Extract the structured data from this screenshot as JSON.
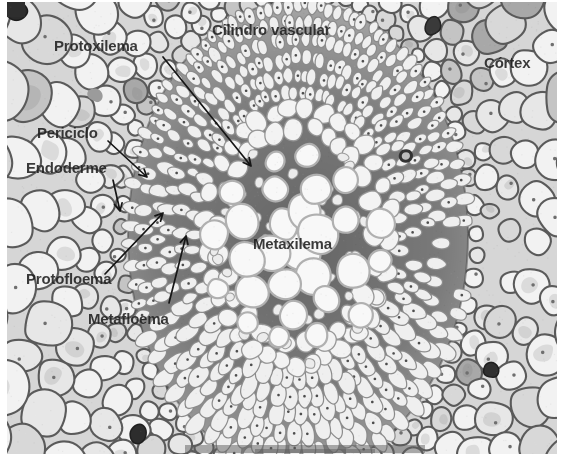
{
  "figure": {
    "labels": [
      {
        "id": "protoxilema",
        "text": "Protoxilema",
        "x": 54,
        "y": 37
      },
      {
        "id": "cilindro-vascular",
        "text": "Cilindro vascular",
        "x": 212,
        "y": 21
      },
      {
        "id": "cortex",
        "text": "Córtex",
        "x": 484,
        "y": 54
      },
      {
        "id": "periciclo",
        "text": "Periciclo",
        "x": 37,
        "y": 124
      },
      {
        "id": "endoderme",
        "text": "Endoderme",
        "x": 26,
        "y": 159
      },
      {
        "id": "protofloema",
        "text": "Protofloema",
        "x": 26,
        "y": 270
      },
      {
        "id": "metafloema",
        "text": "Metafloema",
        "x": 88,
        "y": 310
      },
      {
        "id": "metaxilema",
        "text": "Metaxilema",
        "x": 253,
        "y": 235
      }
    ],
    "arrows": [
      {
        "id": "arrow-protoxilema",
        "x1": 163,
        "y1": 57,
        "x2": 251,
        "y2": 166
      },
      {
        "id": "arrow-periciclo",
        "x1": 108,
        "y1": 141,
        "x2": 147,
        "y2": 177
      },
      {
        "id": "arrow-endoderme",
        "x1": 113,
        "y1": 180,
        "x2": 120,
        "y2": 211
      },
      {
        "id": "arrow-protofloema",
        "x1": 105,
        "y1": 274,
        "x2": 163,
        "y2": 213
      },
      {
        "id": "arrow-metafloema",
        "x1": 169,
        "y1": 303,
        "x2": 186,
        "y2": 236
      }
    ],
    "colors": {
      "label_text": "#1f1f1f",
      "arrow": "#161616",
      "page_bg": "#ffffff",
      "stele_bg": "#6f6f6f",
      "cell_fill": "#f4f4f4"
    }
  }
}
